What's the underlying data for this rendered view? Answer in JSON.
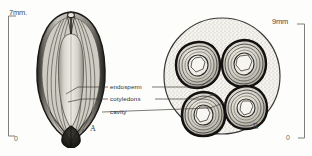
{
  "figure": {
    "background_color": "#fdfdfc",
    "ink_color": "#1f1f1d"
  },
  "scales": {
    "left": {
      "top_label": "7mm.",
      "bottom_label": "0",
      "value": 7,
      "unit": "mm"
    },
    "right": {
      "top_label": "9mm",
      "bottom_label": "0",
      "value": 9,
      "unit": "mm"
    }
  },
  "panels": [
    {
      "letter": "A",
      "name": "longitudinal-section",
      "description": "Longitudinal section of seed showing ribbed seed coat and central endosperm"
    },
    {
      "letter": "B",
      "name": "transverse-section",
      "description": "Transverse section of seed showing four cotyledon lobes in stippled matrix"
    }
  ],
  "callouts": [
    {
      "label": "endosperm",
      "name": "endosperm"
    },
    {
      "label": "cotyledons",
      "name": "cotyledons"
    },
    {
      "label": "cavity",
      "name": "cavity"
    }
  ]
}
